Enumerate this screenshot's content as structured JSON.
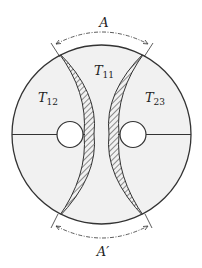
{
  "diagram": {
    "colors": {
      "stroke": "#333333",
      "fill": "#f1f1f1",
      "hatch": "#333333",
      "background": "#ffffff"
    },
    "regions": [
      {
        "id": "T11",
        "label_main": "T",
        "label_sub": "11",
        "position": "top-center"
      },
      {
        "id": "T12",
        "label_main": "T",
        "label_sub": "12",
        "position": "left"
      },
      {
        "id": "T23",
        "label_main": "T",
        "label_sub": "23",
        "position": "right"
      }
    ],
    "dimensions": [
      {
        "id": "A",
        "label": "A",
        "position": "top"
      },
      {
        "id": "A_prime",
        "label": "A′",
        "position": "bottom"
      }
    ]
  }
}
